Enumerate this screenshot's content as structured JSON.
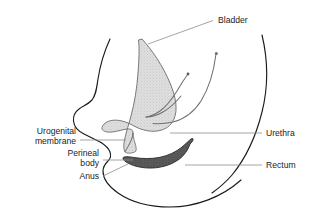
{
  "figure": {
    "background_color": "#ffffff",
    "line_color": "#1b1b1b",
    "leader_color": "#8d8d8d",
    "text_color": "#1b1b1b"
  },
  "labels": {
    "bladder": "Bladder",
    "urethra": "Urethra",
    "rectum": "Rectum",
    "urogenital_membrane_line1": "Urogenital",
    "urogenital_membrane_line2": "membrane",
    "perineal_body_line1": "Perineal",
    "perineal_body_line2": "body",
    "anus": "Anus"
  },
  "structures": {
    "bladder": {
      "name": "bladder",
      "fill_color": "#dcdcdc",
      "stroke_color": "#6b6b6b"
    },
    "rectum": {
      "name": "rectum",
      "fill_color": "#555555",
      "stroke_color": "#2b2b2b"
    },
    "urethra": {
      "name": "urethra",
      "stroke_color": "#6f6f6f"
    },
    "body_outline": {
      "name": "body-outline",
      "stroke_color": "#1b1b1b"
    }
  }
}
